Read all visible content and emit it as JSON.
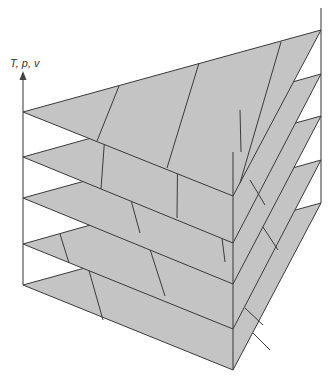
{
  "axis": {
    "label": "T, p, v"
  },
  "colors": {
    "fill": "#c4c4c4",
    "stroke": "#3a3a3a",
    "background": "#ffffff"
  },
  "layers": [
    {
      "name": "layer-1-top",
      "left": [
        23,
        112
      ],
      "right": [
        321,
        30
      ],
      "front": [
        233,
        196
      ]
    },
    {
      "name": "layer-2",
      "left": [
        23,
        157
      ],
      "right": [
        321,
        74
      ],
      "front": [
        233,
        243
      ]
    },
    {
      "name": "layer-3",
      "left": [
        23,
        198
      ],
      "right": [
        321,
        116
      ],
      "front": [
        233,
        284
      ]
    },
    {
      "name": "layer-4",
      "left": [
        23,
        244
      ],
      "right": [
        321,
        160
      ],
      "front": [
        233,
        329
      ]
    },
    {
      "name": "layer-5-bottom",
      "left": [
        23,
        285
      ],
      "right": [
        321,
        203
      ],
      "front": [
        233,
        370
      ]
    }
  ]
}
